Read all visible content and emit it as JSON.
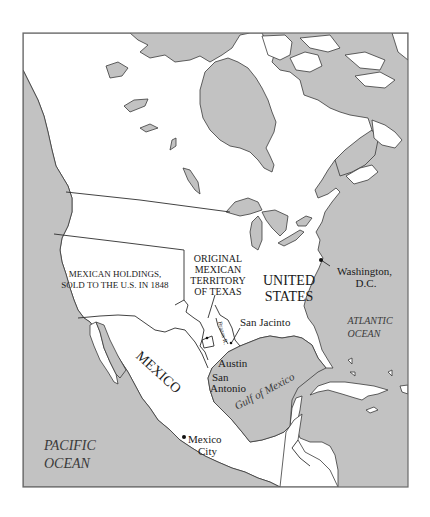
{
  "map": {
    "type": "historical political map",
    "region": "North America",
    "colors": {
      "water": "#c2c2c2",
      "land": "#ffffff",
      "border": "#3a3a3a",
      "frame": "#6a6a6a"
    },
    "labels": {
      "mexican_holdings_line1": "MEXICAN HOLDINGS,",
      "mexican_holdings_line2": "SOLD TO THE U.S. IN 1848",
      "texas_line1": "ORIGINAL",
      "texas_line2": "MEXICAN",
      "texas_line3": "TERRITORY",
      "texas_line4": "OF TEXAS",
      "us_line1": "UNITED",
      "us_line2": "STATES",
      "washington_line1": "Washington,",
      "washington_line2": "D.C.",
      "atlantic_line1": "ATLANTIC",
      "atlantic_line2": "OCEAN",
      "san_jacinto": "San Jacinto",
      "brazos": "Brazos R.",
      "austin": "Austin",
      "san_antonio_line1": "San",
      "san_antonio_line2": "Antonio",
      "gulf": "Gulf of Mexico",
      "mexico": "MEXICO",
      "mexico_city_line1": "Mexico",
      "mexico_city_line2": "City",
      "pacific_line1": "PACIFIC",
      "pacific_line2": "OCEAN"
    },
    "points": [
      {
        "name": "Washington, D.C.",
        "x": 321,
        "y": 260
      },
      {
        "name": "Mexico City",
        "x": 184,
        "y": 437
      },
      {
        "name": "San Jacinto",
        "x": 244,
        "y": 345
      },
      {
        "name": "Austin",
        "x": 207,
        "y": 346
      }
    ]
  }
}
